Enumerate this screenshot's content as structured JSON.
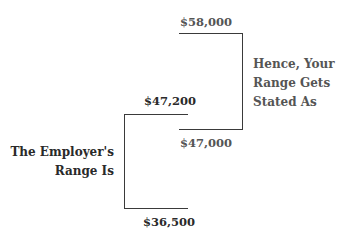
{
  "diagram": {
    "employee_range": {
      "label": "Hence, Your\nRange Gets\nStated As",
      "high": "$58,000",
      "low": "$47,000"
    },
    "employer_range": {
      "label": "The Employer's\nRange Is",
      "high": "$47,200",
      "low": "$36,500"
    }
  },
  "colors": {
    "line": "#3a3a3a",
    "employer_text": "#2a2a2a",
    "employee_text": "#555555"
  }
}
